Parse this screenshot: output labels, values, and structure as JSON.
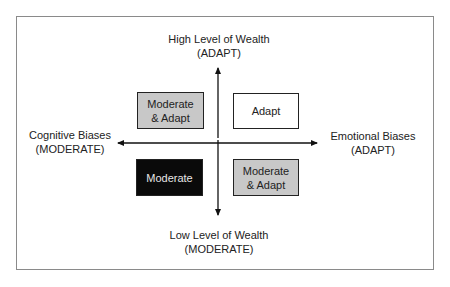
{
  "diagram": {
    "axes": {
      "top": {
        "line1": "High Level of Wealth",
        "line2": "(ADAPT)"
      },
      "bottom": {
        "line1": "Low Level of Wealth",
        "line2": "(MODERATE)"
      },
      "left": {
        "line1": "Cognitive Biases",
        "line2": "(MODERATE)"
      },
      "right": {
        "line1": "Emotional Biases",
        "line2": "(ADAPT)"
      }
    },
    "quadrants": {
      "top_left": {
        "line1": "Moderate",
        "line2": "& Adapt",
        "fill": "#c8c8c8",
        "text_color": "#222222"
      },
      "top_right": {
        "line1": "Adapt",
        "fill": "#ffffff",
        "text_color": "#222222"
      },
      "bottom_left": {
        "line1": "Moderate",
        "fill": "#0a0a0a",
        "text_color": "#e6e6e6"
      },
      "bottom_right": {
        "line1": "Moderate",
        "line2": "& Adapt",
        "fill": "#c8c8c8",
        "text_color": "#222222"
      }
    }
  }
}
